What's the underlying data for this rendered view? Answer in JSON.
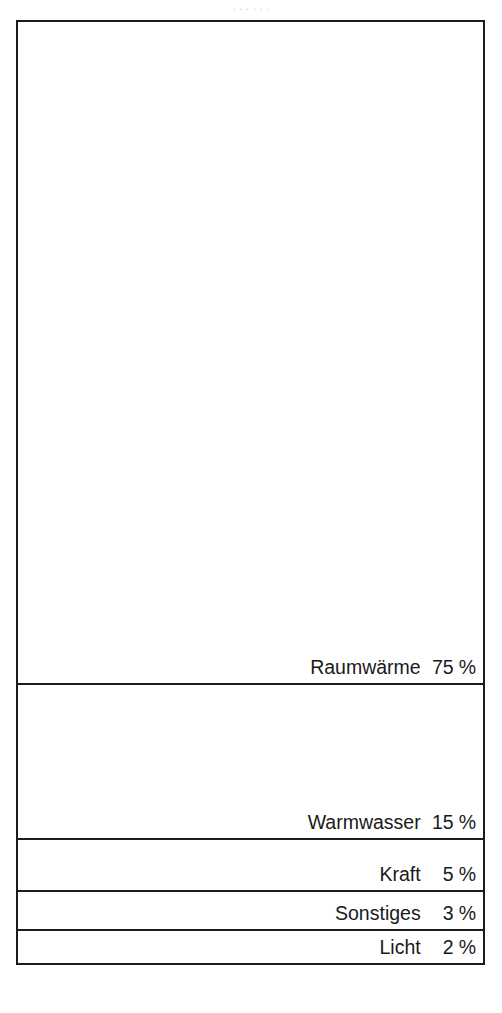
{
  "caption_remnant": ". . . . . .",
  "chart_data": {
    "type": "bar",
    "orientation": "vertical-stacked",
    "title": "",
    "subtitle": "",
    "xlabel": "",
    "ylabel": "",
    "unit": "%",
    "total": 100,
    "grid": false,
    "legend_position": "inline-right",
    "frame_color": "#1c1c1c",
    "fill_color": "#ffffff",
    "text_color": "#1a1a1a",
    "categories": [
      "Raumwärme",
      "Warmwasser",
      "Kraft",
      "Sonstiges",
      "Licht"
    ],
    "values": [
      75,
      15,
      5,
      3,
      2
    ],
    "segments": [
      {
        "label": "Raumwärme",
        "value": "75",
        "unit": "%",
        "height_px": 663
      },
      {
        "label": "Warmwasser",
        "value": "15",
        "unit": "%",
        "height_px": 155
      },
      {
        "label": "Kraft",
        "value": "5",
        "unit": "%",
        "height_px": 52
      },
      {
        "label": "Sonstiges",
        "value": "3",
        "unit": "%",
        "height_px": 39
      },
      {
        "label": "Licht",
        "value": "2",
        "unit": "%",
        "height_px": 32
      }
    ]
  }
}
